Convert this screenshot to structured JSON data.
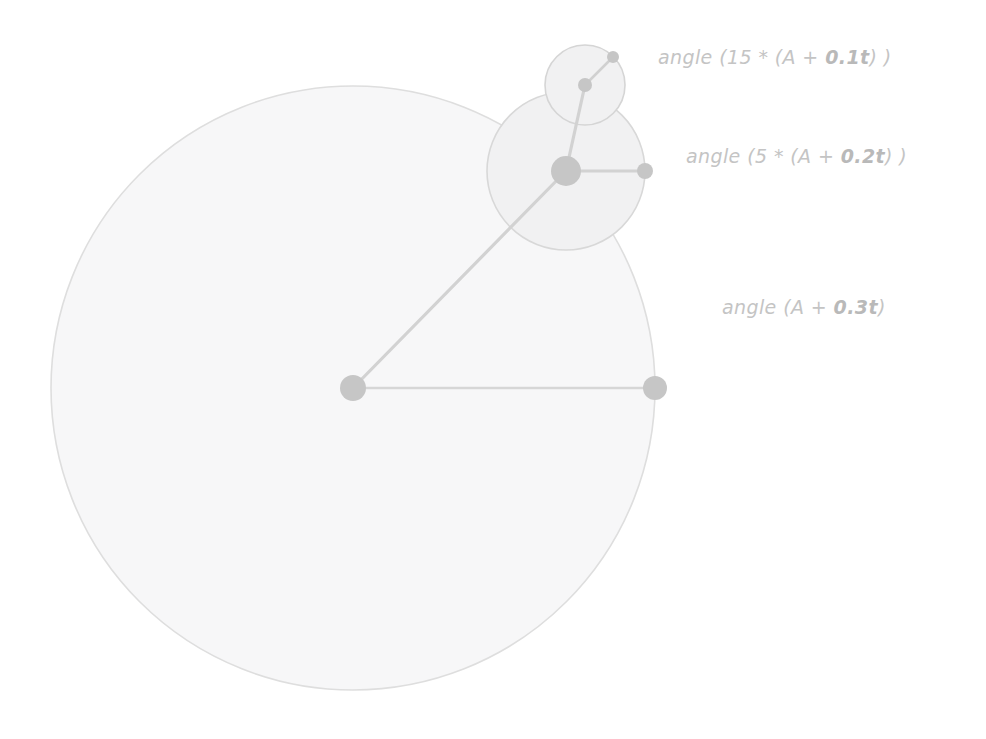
{
  "canvas": {
    "width": 986,
    "height": 739,
    "background": "#ffffff",
    "title": "Nested rotating angle diagram"
  },
  "style": {
    "circle_fill": "#f7f7f8",
    "circle_stroke": "#dedede",
    "node_fill": "#c6c6c6",
    "spoke_stroke": "#d4d4d4",
    "label_color": "#c4c4c4",
    "label_bold_color": "#b9b9b9"
  },
  "labels": [
    {
      "id": "label-inner",
      "prefix": "angle (15 * (A + ",
      "bold": "0.1t",
      "suffix": ") )",
      "full_text": "angle (15 * (A + 0.1t) )",
      "x": 658,
      "y": 46
    },
    {
      "id": "label-middle",
      "prefix": "angle (5 * (A + ",
      "bold": "0.2t",
      "suffix": ") )",
      "full_text": "angle (5 * (A + 0.2t) )",
      "x": 686,
      "y": 145
    },
    {
      "id": "label-outer",
      "prefix": "angle (A + ",
      "bold": "0.3t",
      "suffix": ")",
      "full_text": "angle (A + 0.3t)",
      "x": 722,
      "y": 296
    }
  ],
  "chart_data": {
    "type": "diagram",
    "circles": [
      {
        "name": "outer-circle",
        "level": 1,
        "cx": 353,
        "cy": 388,
        "r": 302,
        "hub_r": 13,
        "rim_node_r": 12,
        "rim_node_x": 655,
        "rim_node_y": 388,
        "spoke_angle_deg": 0,
        "label": "angle (A + 0.3t)",
        "angle_expression": "A + 0.3t",
        "multiplier": 1,
        "rate": 0.3
      },
      {
        "name": "middle-circle",
        "level": 2,
        "cx": 566,
        "cy": 171,
        "r": 79,
        "hub_r": 15,
        "rim_node_r": 8,
        "rim_node_x": 645,
        "rim_node_y": 171,
        "spoke_angle_deg": 0,
        "label": "angle (5 * (A + 0.2t) )",
        "angle_expression": "5 * (A + 0.2t)",
        "multiplier": 5,
        "rate": 0.2
      },
      {
        "name": "inner-circle",
        "level": 3,
        "cx": 585,
        "cy": 85,
        "r": 40,
        "hub_r": 7,
        "rim_node_r": 6,
        "rim_node_x": 613,
        "rim_node_y": 57,
        "spoke_angle_deg": -45,
        "label": "angle (15 * (A + 0.1t) )",
        "angle_expression": "15 * (A + 0.1t)",
        "multiplier": 15,
        "rate": 0.1
      }
    ],
    "connectors": [
      {
        "name": "outer-hub-to-middle-hub",
        "x1": 353,
        "y1": 388,
        "x2": 566,
        "y2": 171
      },
      {
        "name": "middle-hub-to-inner-hub",
        "x1": 566,
        "y1": 171,
        "x2": 585,
        "y2": 85
      }
    ]
  }
}
